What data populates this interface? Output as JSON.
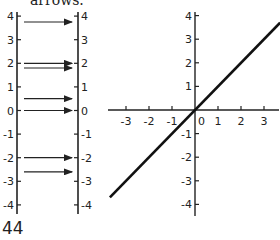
{
  "caption": {
    "text": "arrows."
  },
  "page_number": "44",
  "mapping_diagram": {
    "left_line": {
      "x": 17,
      "ticks": [
        4,
        3,
        2,
        1,
        0,
        -1,
        -2,
        -3,
        -4
      ]
    },
    "right_line": {
      "x": 78,
      "ticks": [
        4,
        3,
        2,
        1,
        0,
        -1,
        -2,
        -3,
        -4
      ]
    },
    "arrows": [
      {
        "from": 3.75,
        "to": 3.75
      },
      {
        "from": 2.0,
        "to": 2.0
      },
      {
        "from": 1.8,
        "to": 1.8
      },
      {
        "from": 0.5,
        "to": 0.5
      },
      {
        "from": 0,
        "to": 0
      },
      {
        "from": -2,
        "to": -2
      },
      {
        "from": -2.6,
        "to": -2.6
      }
    ]
  },
  "chart_data": {
    "type": "line",
    "title": "",
    "xlabel": "",
    "ylabel": "",
    "function": "y = x",
    "x_ticks": [
      -3,
      -2,
      -1,
      0,
      1,
      2,
      3
    ],
    "y_ticks": [
      4,
      3,
      2,
      1,
      -1,
      -2,
      -3,
      -4
    ],
    "xlim": [
      -3.7,
      3.7
    ],
    "ylim": [
      -4.3,
      4.3
    ],
    "grid": false,
    "series": [
      {
        "name": "y = x",
        "x": [
          -3.7,
          3.7
        ],
        "y": [
          -3.7,
          3.7
        ]
      }
    ]
  }
}
